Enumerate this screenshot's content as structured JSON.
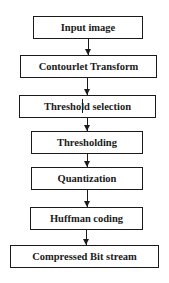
{
  "diagram": {
    "type": "flowchart",
    "direction": "top-to-bottom",
    "nodes": [
      {
        "id": "n1",
        "label": "Input image"
      },
      {
        "id": "n2",
        "label": "Contourlet Transform"
      },
      {
        "id": "n3",
        "label": "Threshold selection"
      },
      {
        "id": "n4",
        "label": "Thresholding"
      },
      {
        "id": "n5",
        "label": "Quantization"
      },
      {
        "id": "n6",
        "label": "Huffman coding"
      },
      {
        "id": "n7",
        "label": "Compressed Bit stream"
      }
    ],
    "edges": [
      {
        "from": "n1",
        "to": "n2"
      },
      {
        "from": "n2",
        "to": "n3"
      },
      {
        "from": "n3",
        "to": "n4"
      },
      {
        "from": "n4",
        "to": "n5"
      },
      {
        "from": "n5",
        "to": "n6"
      },
      {
        "from": "n6",
        "to": "n7"
      }
    ],
    "colors": {
      "stroke": "#1a1a1a",
      "fill": "#ffffff",
      "text": "#1a1a1a"
    }
  }
}
